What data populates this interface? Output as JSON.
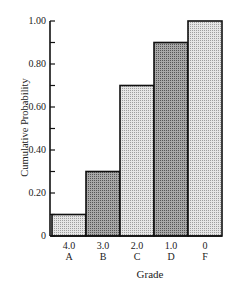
{
  "chart_data": {
    "type": "bar",
    "title": "",
    "xlabel": "Grade",
    "ylabel": "Cumulative Probability",
    "categories": [
      "A",
      "B",
      "C",
      "D",
      "F"
    ],
    "category_points": [
      "4.0",
      "3.0",
      "2.0",
      "1.0",
      "0"
    ],
    "values": [
      0.1,
      0.3,
      0.7,
      0.9,
      1.0
    ],
    "ylim": [
      0,
      1.0
    ],
    "yticks": [
      "0",
      "0.20",
      "0.40",
      "0.60",
      "0.80",
      "1.00"
    ],
    "grid": false,
    "legend": null,
    "bar_fills": [
      "#d9d9d9",
      "#9a9a9a",
      "#dcdcdc",
      "#8f8f8f",
      "#d4d4d4"
    ]
  },
  "axis": {
    "ytick_labels": [
      "0",
      "0.20",
      "0.40",
      "0.60",
      "0.80",
      "1.00"
    ],
    "xtick_top": [
      "4.0",
      "3.0",
      "2.0",
      "1.0",
      "0"
    ],
    "xtick_bottom": [
      "A",
      "B",
      "C",
      "D",
      "F"
    ],
    "xlabel": "Grade",
    "ylabel": "Cumulative Probability"
  }
}
